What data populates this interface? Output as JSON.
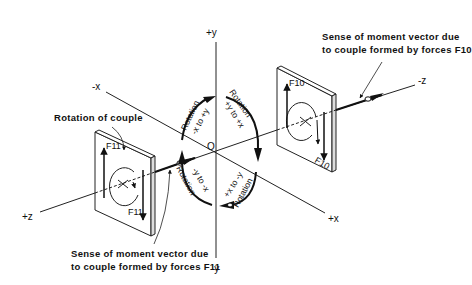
{
  "axes": {
    "plus_y": "+y",
    "minus_y": "-y",
    "plus_x": "+x",
    "minus_x": "-x",
    "plus_z": "+z",
    "minus_z": "-z",
    "origin": "O"
  },
  "rotations": [
    {
      "word": "Rotation",
      "dir": "-x to +y"
    },
    {
      "word": "Rotation",
      "dir": "+y to +x"
    },
    {
      "word": "Rotation",
      "dir": "-y to -x"
    },
    {
      "word": "Rotation",
      "dir": "+x to -y"
    }
  ],
  "forces": {
    "f11_top": "F11",
    "f11_bottom": "F11",
    "f10_top": "F10",
    "f10_bottom": "F10"
  },
  "annotations": {
    "rotation_of_couple": "Rotation of couple",
    "moment_f10_line1": "Sense of moment vector due",
    "moment_f10_line2": "to couple formed by forces F10",
    "moment_f11_line1": "Sense of moment vector due",
    "moment_f11_line2": "to couple formed by forces F11"
  }
}
